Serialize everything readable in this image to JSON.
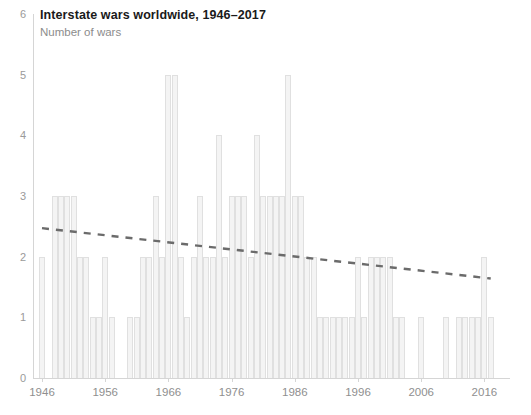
{
  "header": {
    "title": "Interstate wars worldwide, 1946–2017",
    "subtitle": "Number of wars"
  },
  "colors": {
    "bar_fill": "#f4f4f4",
    "bar_stroke": "#e0e0e0",
    "axis": "#d5d5d5",
    "tick_label": "#8f8f8f",
    "title": "#1a1a1a",
    "subtitle": "#8c8c8c",
    "trend_line": "#6b6b6b"
  },
  "chart_data": {
    "type": "bar",
    "title": "Interstate wars worldwide, 1946–2017",
    "subtitle": "Number of wars",
    "xlabel": "",
    "ylabel": "Number of wars",
    "ylim": [
      0,
      6
    ],
    "xlim": [
      1946,
      2017
    ],
    "grid": false,
    "legend": null,
    "ytick_labels": [
      "0",
      "1",
      "2",
      "3",
      "4",
      "5",
      "6"
    ],
    "ytick_values": [
      0,
      1,
      2,
      3,
      4,
      5,
      6
    ],
    "xtick_labels": [
      "1946",
      "1956",
      "1966",
      "1976",
      "1986",
      "1996",
      "2006",
      "2016"
    ],
    "xtick_values": [
      1946,
      1956,
      1966,
      1976,
      1986,
      1996,
      2006,
      2016
    ],
    "categories": [
      1946,
      1947,
      1948,
      1949,
      1950,
      1951,
      1952,
      1953,
      1954,
      1955,
      1956,
      1957,
      1958,
      1959,
      1960,
      1961,
      1962,
      1963,
      1964,
      1965,
      1966,
      1967,
      1968,
      1969,
      1970,
      1971,
      1972,
      1973,
      1974,
      1975,
      1976,
      1977,
      1978,
      1979,
      1980,
      1981,
      1982,
      1983,
      1984,
      1985,
      1986,
      1987,
      1988,
      1989,
      1990,
      1991,
      1992,
      1993,
      1994,
      1995,
      1996,
      1997,
      1998,
      1999,
      2000,
      2001,
      2002,
      2003,
      2004,
      2005,
      2006,
      2007,
      2008,
      2009,
      2010,
      2011,
      2012,
      2013,
      2014,
      2015,
      2016,
      2017
    ],
    "values": [
      2,
      0,
      3,
      3,
      3,
      3,
      2,
      2,
      1,
      1,
      2,
      1,
      0,
      0,
      1,
      1,
      2,
      2,
      3,
      2,
      5,
      5,
      2,
      1,
      2,
      3,
      2,
      2,
      4,
      2,
      3,
      3,
      3,
      2,
      4,
      3,
      3,
      3,
      3,
      5,
      3,
      3,
      2,
      2,
      1,
      1,
      1,
      1,
      1,
      1,
      2,
      1,
      2,
      2,
      2,
      2,
      1,
      1,
      0,
      0,
      1,
      0,
      0,
      0,
      1,
      0,
      1,
      1,
      1,
      1,
      2,
      1
    ],
    "annotations": [
      {
        "type": "trendline",
        "style": "dashed",
        "color": "#6b6b6b",
        "x_start": 1946,
        "y_start": 2.47,
        "x_end": 2017,
        "y_end": 1.64
      }
    ]
  }
}
